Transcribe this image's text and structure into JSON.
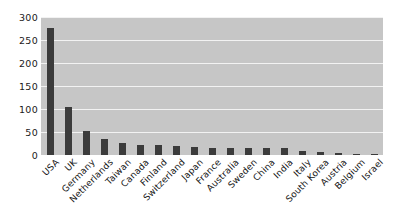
{
  "chart_data": {
    "type": "bar",
    "title": "",
    "subtitle": "",
    "xlabel": "",
    "ylabel": "",
    "ylim": [
      0,
      300
    ],
    "ytick_labels": [
      "0",
      "50",
      "100",
      "150",
      "200",
      "250",
      "300"
    ],
    "ytick_values": [
      0,
      50,
      100,
      150,
      200,
      250,
      300
    ],
    "grid": true,
    "grid_orientation": "horizontal",
    "legend": false,
    "legend_position": "none",
    "bar_color": "#3b3b3b",
    "plot_background_color": "#c6c6c6",
    "gridline_color": "#f2f2f2",
    "page_background_color": "#ffffff",
    "categories": [
      "USA",
      "UK",
      "Germany",
      "Netherlands",
      "Taiwan",
      "Canada",
      "Finland",
      "Switzerland",
      "Japan",
      "France",
      "Australia",
      "Sweden",
      "China",
      "India",
      "Italy",
      "South Korea",
      "Austria",
      "Belgium",
      "Israel"
    ],
    "values": [
      276,
      104,
      52,
      35,
      27,
      22,
      21,
      20,
      18,
      16,
      15,
      15,
      15,
      15,
      9,
      7,
      4,
      3,
      3
    ]
  }
}
